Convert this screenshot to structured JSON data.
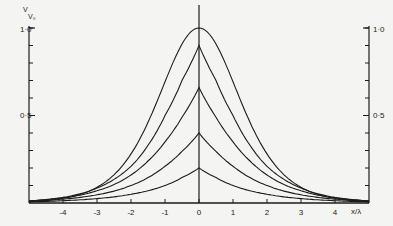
{
  "chart_data": {
    "type": "line",
    "title": "",
    "xlabel": "x/λ",
    "ylabel": "V/V₀",
    "xlim": [
      -5,
      5
    ],
    "ylim": [
      0,
      1.0
    ],
    "grid": false,
    "legend": null,
    "x_ticks": [
      -4,
      -3,
      -2,
      -1,
      0,
      1,
      2,
      3,
      4
    ],
    "x_tick_labels": [
      "-4",
      "-3",
      "-2",
      "-1",
      "0",
      "1",
      "2",
      "3",
      "4"
    ],
    "y_tick_labels": [
      {
        "value": 1.0,
        "label": "1·0"
      },
      {
        "value": 0.5,
        "label": "0·5"
      }
    ],
    "y_minor_tick_step": 0.1,
    "x": [
      -5,
      -4.5,
      -4,
      -3.5,
      -3,
      -2.5,
      -2,
      -1.5,
      -1,
      -0.5,
      0,
      0.5,
      1,
      1.5,
      2,
      2.5,
      3,
      3.5,
      4,
      4.5,
      5
    ],
    "series": [
      {
        "name": "curve-1",
        "peak": 1.0,
        "values": [
          0.008,
          0.014,
          0.025,
          0.045,
          0.08,
          0.14,
          0.24,
          0.39,
          0.62,
          0.89,
          1.0,
          0.89,
          0.62,
          0.39,
          0.24,
          0.14,
          0.08,
          0.045,
          0.025,
          0.014,
          0.008
        ]
      },
      {
        "name": "curve-2",
        "peak": 0.9,
        "values": [
          0.012,
          0.02,
          0.032,
          0.052,
          0.085,
          0.135,
          0.21,
          0.33,
          0.5,
          0.7,
          0.9,
          0.7,
          0.5,
          0.33,
          0.21,
          0.135,
          0.085,
          0.052,
          0.032,
          0.02,
          0.012
        ]
      },
      {
        "name": "curve-3",
        "peak": 0.66,
        "values": [
          0.012,
          0.019,
          0.029,
          0.045,
          0.07,
          0.105,
          0.16,
          0.24,
          0.35,
          0.49,
          0.66,
          0.49,
          0.35,
          0.24,
          0.16,
          0.105,
          0.07,
          0.045,
          0.029,
          0.019,
          0.012
        ]
      },
      {
        "name": "curve-4",
        "peak": 0.4,
        "values": [
          0.01,
          0.015,
          0.022,
          0.032,
          0.047,
          0.068,
          0.1,
          0.145,
          0.21,
          0.295,
          0.4,
          0.295,
          0.21,
          0.145,
          0.1,
          0.068,
          0.047,
          0.032,
          0.022,
          0.015,
          0.01
        ]
      },
      {
        "name": "curve-5",
        "peak": 0.2,
        "values": [
          0.006,
          0.009,
          0.013,
          0.018,
          0.025,
          0.035,
          0.05,
          0.07,
          0.1,
          0.145,
          0.2,
          0.145,
          0.1,
          0.07,
          0.05,
          0.035,
          0.025,
          0.018,
          0.013,
          0.009,
          0.006
        ]
      }
    ]
  },
  "axes": {
    "y_title_top": "V",
    "y_title_bottom": "V₀",
    "x_title": "x/λ",
    "left_top_label": "1·0",
    "left_mid_label": "0·5",
    "right_top_label": "1·0",
    "right_mid_label": "0·5"
  },
  "style": {
    "ink": "#1c1c1c",
    "paper": "#f4f4f2"
  }
}
